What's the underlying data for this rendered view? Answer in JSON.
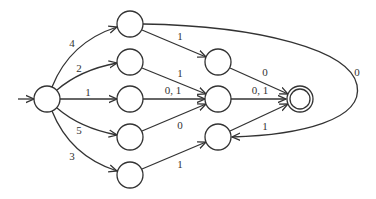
{
  "diagram": {
    "type": "finite-automaton",
    "colors": {
      "stroke": "#333333",
      "background": "#ffffff"
    },
    "nodes": [
      {
        "id": "S",
        "role": "start",
        "cx": 47,
        "cy": 99
      },
      {
        "id": "A",
        "cx": 130,
        "cy": 24
      },
      {
        "id": "B",
        "cx": 130,
        "cy": 62
      },
      {
        "id": "C",
        "cx": 130,
        "cy": 99
      },
      {
        "id": "D",
        "cx": 130,
        "cy": 137
      },
      {
        "id": "E",
        "cx": 130,
        "cy": 175
      },
      {
        "id": "F",
        "cx": 218,
        "cy": 62
      },
      {
        "id": "G",
        "cx": 218,
        "cy": 99
      },
      {
        "id": "H",
        "cx": 218,
        "cy": 137
      },
      {
        "id": "Acc",
        "role": "accepting",
        "cx": 300,
        "cy": 99
      }
    ],
    "edges": [
      {
        "from": "S",
        "to": "A",
        "label": "4"
      },
      {
        "from": "S",
        "to": "B",
        "label": "2"
      },
      {
        "from": "S",
        "to": "C",
        "label": "1"
      },
      {
        "from": "S",
        "to": "D",
        "label": "5"
      },
      {
        "from": "S",
        "to": "E",
        "label": "3"
      },
      {
        "from": "A",
        "to": "F",
        "label": "1"
      },
      {
        "from": "B",
        "to": "G",
        "label": "1"
      },
      {
        "from": "C",
        "to": "G",
        "label": "0, 1"
      },
      {
        "from": "D",
        "to": "G",
        "label": "0"
      },
      {
        "from": "E",
        "to": "H",
        "label": "1"
      },
      {
        "from": "F",
        "to": "Acc",
        "label": "0"
      },
      {
        "from": "G",
        "to": "Acc",
        "label": "0, 1"
      },
      {
        "from": "H",
        "to": "Acc",
        "label": "1"
      },
      {
        "from": "A",
        "to": "H",
        "label": "0"
      }
    ],
    "labels": {
      "s_a": "4",
      "s_b": "2",
      "s_c": "1",
      "s_d": "5",
      "s_e": "3",
      "a_f": "1",
      "b_g": "1",
      "c_g": "0, 1",
      "d_g": "0",
      "e_h": "1",
      "f_acc": "0",
      "g_acc": "0, 1",
      "h_acc": "1",
      "a_h": "0"
    }
  }
}
